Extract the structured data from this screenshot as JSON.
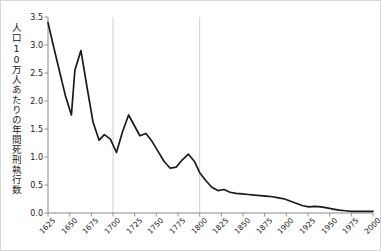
{
  "chart_data": {
    "type": "line",
    "title": "",
    "xlabel": "",
    "ylabel": "人口10万人あたりの年間死刑執行数",
    "xlim": [
      1625,
      2000
    ],
    "ylim": [
      0.0,
      3.5
    ],
    "grid": "vertical-only",
    "legend": "none",
    "yticks": [
      "0.0",
      "0.5",
      "1.0",
      "1.5",
      "2.0",
      "2.5",
      "3.0",
      "3.5"
    ],
    "ytick_values": [
      0.0,
      0.5,
      1.0,
      1.5,
      2.0,
      2.5,
      3.0,
      3.5
    ],
    "xticks": [
      "1625",
      "1650",
      "1675",
      "1700",
      "1725",
      "1750",
      "1775",
      "1800",
      "1825",
      "1850",
      "1875",
      "1900",
      "1925",
      "1950",
      "1975",
      "2000"
    ],
    "xtick_values": [
      1625,
      1650,
      1675,
      1700,
      1725,
      1750,
      1775,
      1800,
      1825,
      1850,
      1875,
      1900,
      1925,
      1950,
      1975,
      2000
    ],
    "vertical_gridlines": [
      1700,
      1800
    ],
    "series": [
      {
        "name": "年間死刑執行数",
        "color": "#1a1a1a",
        "x": [
          1625,
          1631,
          1638,
          1645,
          1652,
          1656,
          1663,
          1670,
          1677,
          1684,
          1690,
          1697,
          1704,
          1711,
          1718,
          1724,
          1731,
          1738,
          1745,
          1752,
          1759,
          1766,
          1773,
          1780,
          1787,
          1794,
          1800,
          1807,
          1814,
          1821,
          1828,
          1835,
          1842,
          1849,
          1856,
          1863,
          1870,
          1877,
          1884,
          1891,
          1898,
          1905,
          1912,
          1919,
          1926,
          1933,
          1940,
          1947,
          1954,
          1961,
          1968,
          1975,
          1982,
          1989,
          1996,
          2000
        ],
        "y": [
          3.4,
          3.0,
          2.55,
          2.1,
          1.75,
          2.55,
          2.9,
          2.25,
          1.62,
          1.3,
          1.4,
          1.32,
          1.08,
          1.45,
          1.75,
          1.58,
          1.38,
          1.42,
          1.28,
          1.1,
          0.92,
          0.8,
          0.82,
          0.95,
          1.05,
          0.92,
          0.72,
          0.58,
          0.46,
          0.4,
          0.42,
          0.37,
          0.35,
          0.34,
          0.33,
          0.32,
          0.31,
          0.3,
          0.29,
          0.27,
          0.25,
          0.21,
          0.17,
          0.13,
          0.11,
          0.12,
          0.11,
          0.09,
          0.07,
          0.05,
          0.04,
          0.03,
          0.03,
          0.03,
          0.03,
          0.03
        ]
      }
    ]
  },
  "caption": {
    "text": ""
  }
}
